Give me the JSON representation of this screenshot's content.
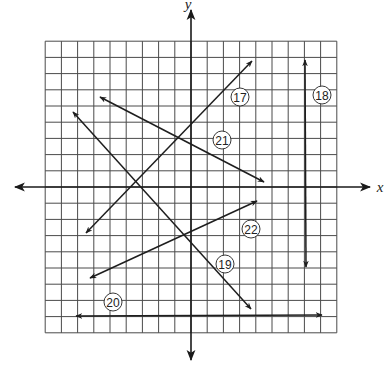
{
  "graph": {
    "axes": {
      "x_label": "x",
      "y_label": "y",
      "origin_px": [
        191,
        187
      ],
      "unit_px": 16.2,
      "grid_range": [
        -9,
        9
      ]
    },
    "lines": [
      {
        "id": "17",
        "label": "17",
        "from": [
          86,
          233
        ],
        "to": [
          252,
          61
        ],
        "arrow_start": true,
        "arrow_end": true,
        "label_pos": [
          240,
          97
        ]
      },
      {
        "id": "18",
        "label": "18",
        "from": [
          306,
          267
        ],
        "to": [
          305,
          60
        ],
        "arrow_start": true,
        "arrow_end": true,
        "label_pos": [
          322,
          95
        ]
      },
      {
        "id": "19",
        "label": "19",
        "from": [
          73,
          112
        ],
        "to": [
          251,
          309
        ],
        "arrow_start": true,
        "arrow_end": true,
        "label_pos": [
          225,
          264
        ]
      },
      {
        "id": "20",
        "label": "20",
        "from": [
          76,
          316
        ],
        "to": [
          322,
          315
        ],
        "arrow_start": true,
        "arrow_end": true,
        "label_pos": [
          113,
          302
        ]
      },
      {
        "id": "21",
        "label": "21",
        "from": [
          100,
          97
        ],
        "to": [
          264,
          182
        ],
        "arrow_start": true,
        "arrow_end": true,
        "label_pos": [
          222,
          140
        ]
      },
      {
        "id": "22",
        "label": "22",
        "from": [
          90,
          278
        ],
        "to": [
          257,
          201
        ],
        "arrow_start": true,
        "arrow_end": true,
        "label_pos": [
          251,
          229
        ]
      }
    ]
  }
}
